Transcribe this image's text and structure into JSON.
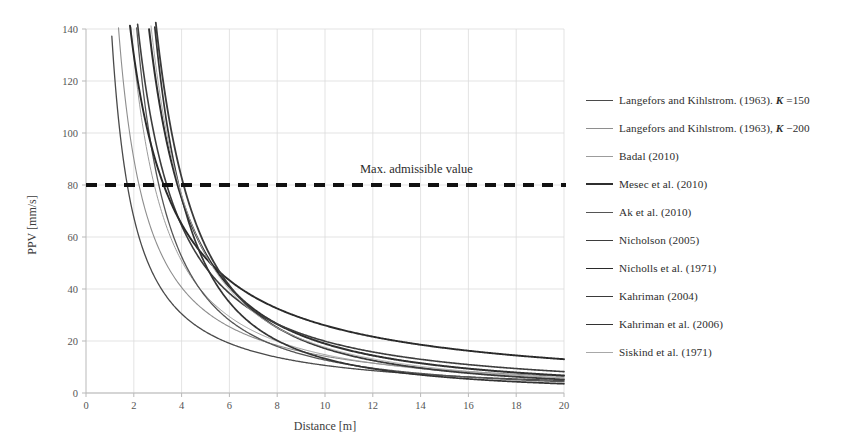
{
  "chart_data": {
    "type": "line",
    "title": "",
    "xlabel": "Distance [m]",
    "ylabel": "PPV [mm/s]",
    "xlim": [
      0,
      20
    ],
    "ylim": [
      0,
      140
    ],
    "xticks": [
      0,
      2,
      4,
      6,
      8,
      10,
      12,
      14,
      16,
      18,
      20
    ],
    "yticks": [
      0,
      20,
      40,
      60,
      80,
      100,
      120,
      140
    ],
    "grid": true,
    "legend_position": "right",
    "annotations": [
      {
        "text": "Max. admissible value",
        "type": "threshold-line",
        "y": 80,
        "style": "thick-dashed",
        "color": "#111111"
      }
    ],
    "x": [
      1,
      1.5,
      2,
      2.5,
      3,
      4,
      5,
      6,
      7,
      8,
      9,
      10,
      11,
      12,
      13,
      14,
      15,
      16,
      17,
      18,
      19,
      20
    ],
    "series": [
      {
        "name": "Langefors and Kihlstrom (1963), K=150",
        "label_html": "Langefors and Kihlstrom. (1963). <i>K</i> =150",
        "color": "#4a4a4a",
        "width": 1.3,
        "K": 150,
        "n": 1.15,
        "values": [
          150,
          94.5,
          67.8,
          52.2,
          42.1,
          30.3,
          23.5,
          19.1,
          16.1,
          13.8,
          12.1,
          10.7,
          9.6,
          8.7,
          7.9,
          7.3,
          6.7,
          6.3,
          5.9,
          5.5,
          5.2,
          4.9
        ]
      },
      {
        "name": "Langefors and Kihlstrom (1963), K=200",
        "label_html": "Langefors and Kihlstrom. (1963), <i>K</i> −200",
        "color": "#8e8e8e",
        "width": 1.1,
        "K": 200,
        "n": 1.15,
        "values": [
          200,
          126,
          90.3,
          69.6,
          56.1,
          40.4,
          31.3,
          25.5,
          21.4,
          18.4,
          16.1,
          14.3,
          12.8,
          11.6,
          10.6,
          9.7,
          9.0,
          8.3,
          7.8,
          7.3,
          6.9,
          6.5
        ]
      },
      {
        "name": "Badal (2010)",
        "label_html": "Badal (2010)",
        "color": "#9c9c9c",
        "width": 1.0,
        "K": 330,
        "n": 1.35,
        "values": [
          330,
          191,
          129,
          95.0,
          73.8,
          50.0,
          37.1,
          29.1,
          23.8,
          20.0,
          17.2,
          15.1,
          13.4,
          12.0,
          10.9,
          9.9,
          9.1,
          8.4,
          7.8,
          7.3,
          6.8,
          6.4
        ]
      },
      {
        "name": "Mesec et al. (2010)",
        "label_html": "Mesec et al. (2010)",
        "color": "#2f2f2f",
        "width": 2.0,
        "K": 600,
        "n": 1.5,
        "values": [
          600,
          326,
          212,
          152,
          115,
          75.0,
          53.7,
          40.8,
          32.4,
          26.5,
          22.2,
          19.0,
          16.5,
          14.4,
          12.8,
          11.5,
          10.3,
          9.4,
          8.6,
          7.9,
          7.2,
          6.7
        ]
      },
      {
        "name": "Ak et al. (2010)",
        "label_html": "Ak et al. (2010)",
        "color": "#555555",
        "width": 1.3,
        "K": 450,
        "n": 1.55,
        "values": [
          450,
          238,
          153,
          108,
          81.0,
          51.4,
          36.2,
          27.1,
          21.2,
          17.1,
          14.2,
          12.0,
          10.3,
          9.0,
          7.9,
          7.0,
          6.3,
          5.7,
          5.2,
          4.7,
          4.4,
          4.0
        ]
      },
      {
        "name": "Nicholson (2005)",
        "label_html": "Nicholson (2005)",
        "color": "#3d3d3d",
        "width": 1.6,
        "K": 380,
        "n": 1.28,
        "values": [
          380,
          228,
          157,
          118,
          92.8,
          64.5,
          49.0,
          39.3,
          32.7,
          27.9,
          24.2,
          21.4,
          19.1,
          17.3,
          15.7,
          14.4,
          13.3,
          12.3,
          11.5,
          10.8,
          10.1,
          9.6
        ]
      },
      {
        "name": "Nicholls et al. (1971)",
        "label_html": "Nicholls et al. (1971)",
        "color": "#2a2a2a",
        "width": 1.9,
        "K": 260,
        "n": 1.0,
        "values": [
          260,
          173,
          130,
          104,
          86.7,
          65.0,
          52.0,
          43.3,
          37.1,
          32.5,
          28.9,
          26.0,
          23.6,
          21.7,
          20.0,
          18.6,
          17.3,
          16.3,
          15.3,
          14.4,
          13.7,
          13.0
        ]
      },
      {
        "name": "Kahriman (2004)",
        "label_html": "Kahriman (2004)",
        "color": "#3a3a3a",
        "width": 1.8,
        "K": 900,
        "n": 1.72,
        "values": [
          900,
          443,
          273,
          187,
          137,
          83.0,
          56.5,
          41.4,
          31.9,
          25.4,
          20.8,
          17.5,
          14.9,
          12.9,
          11.3,
          10.0,
          8.9,
          8.0,
          7.2,
          6.6,
          6.0,
          5.5
        ]
      },
      {
        "name": "Kahriman et al. (2006)",
        "label_html": "Kahriman et al. (2006)",
        "color": "#333333",
        "width": 1.7,
        "K": 1050,
        "n": 1.9,
        "values": [
          1050,
          489,
          281,
          184,
          130,
          73.5,
          48.0,
          33.8,
          25.2,
          19.5,
          15.6,
          12.8,
          10.7,
          9.1,
          7.8,
          6.8,
          6.0,
          5.3,
          4.7,
          4.2,
          3.8,
          3.5
        ]
      },
      {
        "name": "Siskind et al. (1971)",
        "label_html": "Siskind et al. (1971)",
        "color": "#a8a8a8",
        "width": 1.0,
        "K": 700,
        "n": 1.6,
        "values": [
          700,
          364,
          231,
          161,
          120,
          74.2,
          51.4,
          38.1,
          29.6,
          23.8,
          19.6,
          16.5,
          14.1,
          12.2,
          10.7,
          9.5,
          8.5,
          7.6,
          6.9,
          6.3,
          5.8,
          5.3
        ]
      }
    ]
  },
  "axes": {
    "ylabel": "PPV [mm/s]",
    "xlabel": "Distance [m]",
    "xticks": [
      "0",
      "2",
      "4",
      "6",
      "8",
      "10",
      "12",
      "14",
      "16",
      "18",
      "20"
    ],
    "yticks": [
      "0",
      "20",
      "40",
      "60",
      "80",
      "100",
      "120",
      "140"
    ]
  },
  "annotation": {
    "max_admissible_label": "Max. admissible value",
    "max_admissible_value": 80
  },
  "legend": {
    "items": [
      {
        "label": "Langefors and Kihlstrom. (1963). K =150",
        "label_html": "Langefors and Kihlstrom. (1963). <i>K</i> =150",
        "color": "#4a4a4a",
        "width": 1.3
      },
      {
        "label": "Langefors and Kihlstrom. (1963), K −200",
        "label_html": "Langefors and Kihlstrom. (1963), <i>K</i> −200",
        "color": "#8e8e8e",
        "width": 1.1
      },
      {
        "label": "Badal (2010)",
        "label_html": "Badal (2010)",
        "color": "#9c9c9c",
        "width": 1.0
      },
      {
        "label": "Mesec et al. (2010)",
        "label_html": "Mesec et al. (2010)",
        "color": "#2f2f2f",
        "width": 2.0
      },
      {
        "label": "Ak et al. (2010)",
        "label_html": "Ak et al. (2010)",
        "color": "#555555",
        "width": 1.3
      },
      {
        "label": "Nicholson (2005)",
        "label_html": "Nicholson (2005)",
        "color": "#3d3d3d",
        "width": 1.6
      },
      {
        "label": "Nicholls et al. (1971)",
        "label_html": "Nicholls et al. (1971)",
        "color": "#2a2a2a",
        "width": 1.9
      },
      {
        "label": "Kahriman (2004)",
        "label_html": "Kahriman (2004)",
        "color": "#3a3a3a",
        "width": 1.8
      },
      {
        "label": "Kahriman et al. (2006)",
        "label_html": "Kahriman et al. (2006)",
        "color": "#333333",
        "width": 1.7
      },
      {
        "label": "Siskind et al. (1971)",
        "label_html": "Siskind et al. (1971)",
        "color": "#a8a8a8",
        "width": 1.0
      }
    ]
  },
  "style": {
    "grid_color": "#dcdcdc",
    "axis_color": "#b9b9b9",
    "threshold_color": "#111111",
    "background": "#ffffff"
  }
}
